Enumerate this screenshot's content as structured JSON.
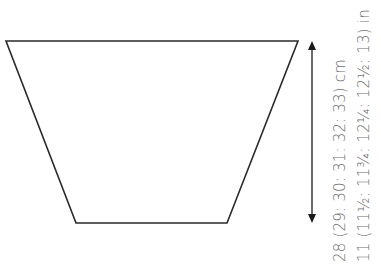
{
  "diagram": {
    "type": "knitting-schematic",
    "shape": "inverted-trapezoid",
    "shape_points": [
      [
        6,
        41
      ],
      [
        298,
        41
      ],
      [
        227,
        223
      ],
      [
        76,
        223
      ]
    ],
    "dimension_arrow": {
      "x": 312,
      "y1": 42,
      "y2": 222,
      "direction": "vertical",
      "ends": "double-arrow"
    },
    "measurements": {
      "cm": "28 (29: 30: 31: 32: 33) cm",
      "in": "11 (11½: 11¾: 12¼: 12½: 13) in"
    },
    "colors": {
      "outline": "#2a2a2a",
      "text": "#6f6f6f",
      "background": "#ffffff"
    }
  }
}
